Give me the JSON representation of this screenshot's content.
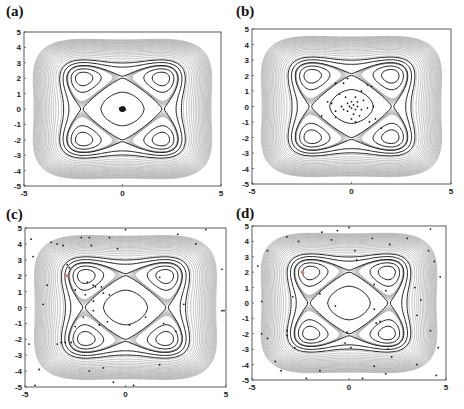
{
  "figure": {
    "panels": [
      {
        "label": "(a)",
        "box": [
          24,
          32,
          221,
          186
        ],
        "label_pos": [
          6,
          3
        ]
      },
      {
        "label": "(b)",
        "box": [
          252,
          29,
          451,
          184
        ],
        "label_pos": [
          236,
          3
        ]
      },
      {
        "label": "(c)",
        "box": [
          25,
          228,
          226,
          387
        ],
        "label_pos": [
          6,
          206
        ]
      },
      {
        "label": "(d)",
        "box": [
          252,
          226,
          446,
          380
        ],
        "label_pos": [
          236,
          205
        ]
      }
    ]
  },
  "chart_data": [
    {
      "type": "contour+scatter",
      "title": "(a)",
      "xlim": [
        -5,
        5
      ],
      "ylim": [
        -5,
        5
      ],
      "xticks": [
        "-5",
        "0",
        "5"
      ],
      "yticks": [
        "5",
        "4",
        "3",
        "2",
        "1",
        "0",
        "-1",
        "-2",
        "-3",
        "-4",
        "-5"
      ],
      "minima": [
        [
          -2,
          2
        ],
        [
          2,
          2
        ],
        [
          -2,
          -2
        ],
        [
          2,
          -2
        ]
      ],
      "points": "dense cluster at (0,0)",
      "scatter": [
        [
          0,
          0
        ],
        [
          0.05,
          0.05
        ],
        [
          -0.05,
          0.03
        ],
        [
          0.03,
          -0.06
        ],
        [
          -0.06,
          -0.04
        ],
        [
          0.08,
          0
        ],
        [
          -0.08,
          0.01
        ],
        [
          0,
          0.08
        ],
        [
          0.02,
          -0.09
        ],
        [
          -0.03,
          0.07
        ],
        [
          0.06,
          0.07
        ],
        [
          -0.07,
          -0.08
        ],
        [
          0.1,
          -0.04
        ],
        [
          -0.1,
          0.05
        ]
      ]
    },
    {
      "type": "contour+scatter",
      "title": "(b)",
      "xlim": [
        -5,
        5
      ],
      "ylim": [
        -5,
        5
      ],
      "xticks": [
        "-5",
        "0",
        "5"
      ],
      "yticks": [
        "5",
        "4",
        "3",
        "2",
        "1",
        "0",
        "-1",
        "-2",
        "-3",
        "-4",
        "-5"
      ],
      "scatter": [
        [
          -0.2,
          1.8
        ],
        [
          -0.8,
          1.5
        ],
        [
          0.8,
          1.4
        ],
        [
          -0.4,
          1.5
        ],
        [
          1.0,
          1.3
        ],
        [
          -0.6,
          0.8
        ],
        [
          0.5,
          1.0
        ],
        [
          -0.3,
          0.6
        ],
        [
          0.2,
          0.6
        ],
        [
          0.6,
          0.4
        ],
        [
          -1.2,
          0.3
        ],
        [
          -1.0,
          0.2
        ],
        [
          -0.5,
          0.0
        ],
        [
          0.0,
          0.3
        ],
        [
          0.1,
          0.1
        ],
        [
          0.0,
          -0.1
        ],
        [
          -0.1,
          0.0
        ],
        [
          0.2,
          -0.2
        ],
        [
          0.3,
          0.0
        ],
        [
          -0.2,
          -0.3
        ],
        [
          0.5,
          -0.2
        ],
        [
          0.8,
          -0.1
        ],
        [
          1.1,
          0.0
        ],
        [
          -0.8,
          -0.3
        ],
        [
          -1.5,
          -0.6
        ],
        [
          -0.8,
          -0.7
        ],
        [
          0.0,
          -0.8
        ],
        [
          0.2,
          -1.0
        ],
        [
          0.9,
          -1.0
        ],
        [
          1.2,
          -0.8
        ],
        [
          0.4,
          -0.6
        ],
        [
          -0.4,
          -0.2
        ],
        [
          0.1,
          -0.5
        ],
        [
          1.5,
          -1.4
        ],
        [
          0.3,
          0.3
        ],
        [
          -0.2,
          0.2
        ]
      ]
    },
    {
      "type": "contour+scatter",
      "title": "(c)",
      "xlim": [
        -5,
        5
      ],
      "ylim": [
        -5,
        5
      ],
      "xticks": [
        "-5",
        "0",
        "5"
      ],
      "yticks": [
        "5",
        "4",
        "3",
        "2",
        "1",
        "0",
        "-1",
        "-2",
        "-3",
        "-4",
        "-5"
      ],
      "highlight": [
        -2.9,
        2.0
      ],
      "scatter": [
        [
          -4.7,
          4.3
        ],
        [
          -2.2,
          4.4
        ],
        [
          -3.4,
          4.0
        ],
        [
          -3.7,
          4.1
        ],
        [
          -3.1,
          3.9
        ],
        [
          -1.8,
          4.4
        ],
        [
          -0.4,
          3.7
        ],
        [
          -1.7,
          3.9
        ],
        [
          0.0,
          4.9
        ],
        [
          -0.8,
          4.4
        ],
        [
          2.6,
          4.6
        ],
        [
          3.5,
          4.0
        ],
        [
          4.0,
          4.9
        ],
        [
          -4.6,
          3.2
        ],
        [
          -2.9,
          2.7
        ],
        [
          -2.8,
          2.5
        ],
        [
          -1.9,
          1.6
        ],
        [
          -1.6,
          1.4
        ],
        [
          -1.2,
          1.3
        ],
        [
          -2.5,
          1.1
        ],
        [
          -1.5,
          1.3
        ],
        [
          -1.1,
          0.9
        ],
        [
          -0.8,
          0.8
        ],
        [
          -2.0,
          0.8
        ],
        [
          -3.9,
          1.4
        ],
        [
          -1.6,
          0.4
        ],
        [
          -4.1,
          0.2
        ],
        [
          1.7,
          1.9
        ],
        [
          4.8,
          2.4
        ],
        [
          2.9,
          0.2
        ],
        [
          4.8,
          -0.2
        ],
        [
          -1.6,
          -0.2
        ],
        [
          -2.1,
          -0.6
        ],
        [
          -0.9,
          -0.9
        ],
        [
          -2.5,
          -1.2
        ],
        [
          -1.3,
          -1.1
        ],
        [
          0.2,
          -1.1
        ],
        [
          1.0,
          -0.6
        ],
        [
          1.9,
          -1.0
        ],
        [
          -3.0,
          -2.2
        ],
        [
          -3.2,
          -2.2
        ],
        [
          -3.4,
          -2.3
        ],
        [
          -2.7,
          -2.2
        ],
        [
          -4.8,
          -2.3
        ],
        [
          1.7,
          -3.6
        ],
        [
          -4.3,
          -3.9
        ],
        [
          -1.8,
          -4.0
        ],
        [
          -1.1,
          -3.8
        ],
        [
          -0.6,
          -4.7
        ],
        [
          0.4,
          -4.9
        ],
        [
          -4.5,
          -4.9
        ],
        [
          4.9,
          -0.2
        ],
        [
          2.5,
          -1.5
        ]
      ]
    },
    {
      "type": "contour+scatter",
      "title": "(d)",
      "xlim": [
        -5,
        5
      ],
      "ylim": [
        -5,
        5
      ],
      "xticks": [
        "-5",
        "0",
        "5"
      ],
      "yticks": [
        "5",
        "4",
        "3",
        "2",
        "1",
        "0",
        "-1",
        "-2",
        "-3",
        "-4",
        "-5"
      ],
      "highlight": [
        -2.4,
        2.0
      ],
      "scatter": [
        [
          -1.4,
          4.6
        ],
        [
          -0.6,
          4.7
        ],
        [
          0.0,
          4.9
        ],
        [
          1.2,
          4.2
        ],
        [
          3.0,
          4.2
        ],
        [
          4.2,
          4.8
        ],
        [
          -3.2,
          4.3
        ],
        [
          -2.6,
          4.0
        ],
        [
          -4.2,
          3.4
        ],
        [
          -0.9,
          4.1
        ],
        [
          0.3,
          3.4
        ],
        [
          0.4,
          2.8
        ],
        [
          2.1,
          3.8
        ],
        [
          4.1,
          3.4
        ],
        [
          4.4,
          2.7
        ],
        [
          -4.7,
          2.4
        ],
        [
          1.3,
          1.2
        ],
        [
          -2.9,
          0.4
        ],
        [
          -1.5,
          0.6
        ],
        [
          -0.7,
          -0.2
        ],
        [
          1.3,
          -0.4
        ],
        [
          1.9,
          0.8
        ],
        [
          3.4,
          1.0
        ],
        [
          4.7,
          1.7
        ],
        [
          3.7,
          0.2
        ],
        [
          -4.5,
          0.1
        ],
        [
          -4.5,
          -2.0
        ],
        [
          -3.2,
          -1.8
        ],
        [
          -3.2,
          -2.1
        ],
        [
          -2.8,
          -2.9
        ],
        [
          -4.2,
          -2.3
        ],
        [
          1.6,
          -1.2
        ],
        [
          1.4,
          -1.3
        ],
        [
          3.5,
          -0.8
        ],
        [
          -0.1,
          -1.9
        ],
        [
          -0.2,
          -2.6
        ],
        [
          0.1,
          -2.9
        ],
        [
          2.0,
          -3.0
        ],
        [
          2.2,
          -3.5
        ],
        [
          4.6,
          -2.9
        ],
        [
          4.2,
          -1.8
        ],
        [
          -3.8,
          -3.8
        ],
        [
          -3.5,
          -4.4
        ],
        [
          -1.5,
          -4.4
        ],
        [
          1.3,
          -4.1
        ],
        [
          3.5,
          -4.0
        ],
        [
          -2.2,
          -4.9
        ],
        [
          0.7,
          -4.9
        ],
        [
          1.9,
          -4.6
        ],
        [
          4.5,
          -4.7
        ]
      ]
    }
  ],
  "colors": {
    "contour_dark": "#222222",
    "contour_light": "#9a9a9a",
    "point": "#1a1a1a",
    "highlight": "#d27a7a",
    "axis": "#333333"
  }
}
